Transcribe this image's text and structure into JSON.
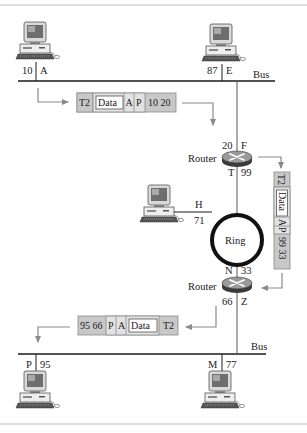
{
  "colors": {
    "line": "#1a1a1a",
    "arrow": "#8a8a8a",
    "frame_fill": "#c8c8c8",
    "frame_light": "#e2e2e2",
    "border": "#bdbdbd",
    "router_top": "#9a9a9a",
    "router_side": "#3a3a3a"
  },
  "labels": {
    "bus_top": "Bus",
    "bus_bottom": "Bus",
    "ring": "Ring",
    "router_top": "Router",
    "router_bottom": "Router"
  },
  "hosts": {
    "A": {
      "name": "A",
      "address": "10"
    },
    "E": {
      "name": "E",
      "address": "87"
    },
    "H": {
      "name": "H",
      "address": "71"
    },
    "P": {
      "name": "P",
      "address": "95"
    },
    "M": {
      "name": "M",
      "address": "77"
    }
  },
  "routers": {
    "top": {
      "iface_upper_addr": "20",
      "iface_upper_name": "F",
      "iface_lower_name": "T",
      "iface_lower_addr": "99"
    },
    "bottom": {
      "iface_upper_name": "N",
      "iface_upper_addr": "33",
      "iface_lower_addr": "66",
      "iface_lower_name": "Z"
    }
  },
  "frames": {
    "top": {
      "trailer": "T2",
      "data": "Data",
      "a": "A",
      "p": "P",
      "header": "10 20"
    },
    "right": {
      "trailer": "T2",
      "data": "Data",
      "a": "A",
      "p": "P",
      "header": "99 33"
    },
    "bottom": {
      "header": "95 66",
      "p": "P",
      "a": "A",
      "data": "Data",
      "trailer": "T2"
    }
  }
}
